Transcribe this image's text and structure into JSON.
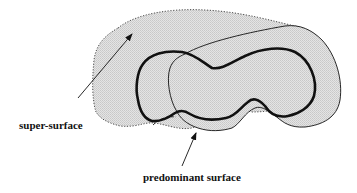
{
  "diagram": {
    "labels": {
      "super_surface": "super-surface",
      "predominant_surface": "predominant surface"
    },
    "colors": {
      "fill": "#dcdcdc",
      "stroke": "#111111",
      "background": "#ffffff"
    },
    "shapes": [
      {
        "name": "super-surface",
        "style": "dotted outline, gray stippled fill"
      },
      {
        "name": "predominant surface",
        "style": "thick solid outline"
      },
      {
        "name": "overlapping surface",
        "style": "thin solid outline"
      }
    ],
    "arrows": [
      {
        "from_label": "super-surface",
        "points_to": "super-surface region"
      },
      {
        "from_label": "predominant surface",
        "points_to": "predominant surface outline"
      }
    ]
  }
}
